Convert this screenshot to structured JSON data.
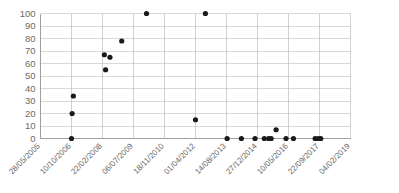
{
  "chart_data": {
    "type": "scatter",
    "title": "",
    "xlabel": "",
    "ylabel": "",
    "ylim": [
      0,
      100
    ],
    "ytick_values": [
      0,
      10,
      20,
      30,
      40,
      50,
      60,
      70,
      80,
      90,
      100
    ],
    "ytick_labels": [
      "0",
      "10",
      "20",
      "30",
      "40",
      "50",
      "60",
      "70",
      "80",
      "90",
      "100"
    ],
    "xtick_labels": [
      "28/05/2005",
      "10/10/2006",
      "22/02/2008",
      "06/07/2009",
      "18/11/2010",
      "01/04/2012",
      "14/08/2013",
      "27/12/2014",
      "10/05/2016",
      "22/09/2017",
      "04/02/2019"
    ],
    "xtick_positions": [
      0,
      1,
      2,
      3,
      4,
      5,
      6,
      7,
      8,
      9,
      10
    ],
    "grid": true,
    "legend": null,
    "marker": "circle",
    "marker_color": "#1a1a1a",
    "points": [
      {
        "x": 1.0,
        "label": "10/10/2006",
        "y": 0
      },
      {
        "x": 1.02,
        "label": "10/10/2006",
        "y": 20
      },
      {
        "x": 1.06,
        "label": "22/11/2006",
        "y": 34
      },
      {
        "x": 2.1,
        "label": "06/04/2008",
        "y": 55
      },
      {
        "x": 2.06,
        "label": "21/03/2008",
        "y": 67
      },
      {
        "x": 2.24,
        "label": "02/06/2008",
        "y": 65
      },
      {
        "x": 2.62,
        "label": "15/11/2008",
        "y": 78
      },
      {
        "x": 3.42,
        "label": "28/12/2009",
        "y": 100
      },
      {
        "x": 5.32,
        "label": "02/09/2012",
        "y": 100
      },
      {
        "x": 5.0,
        "label": "01/04/2012",
        "y": 15
      },
      {
        "x": 6.02,
        "label": "14/08/2013",
        "y": 0
      },
      {
        "x": 6.48,
        "label": "05/03/2014",
        "y": 0
      },
      {
        "x": 6.92,
        "label": "25/11/2014",
        "y": 0
      },
      {
        "x": 7.22,
        "label": "15/04/2015",
        "y": 0
      },
      {
        "x": 7.36,
        "label": "12/06/2015",
        "y": 0
      },
      {
        "x": 7.44,
        "label": "15/07/2015",
        "y": 0
      },
      {
        "x": 7.6,
        "label": "20/09/2015",
        "y": 7
      },
      {
        "x": 7.92,
        "label": "20/01/2016",
        "y": 0
      },
      {
        "x": 8.16,
        "label": "06/04/2016",
        "y": 0
      },
      {
        "x": 8.86,
        "label": "25/01/2017",
        "y": 0
      },
      {
        "x": 8.96,
        "label": "05/03/2017",
        "y": 0
      },
      {
        "x": 9.04,
        "label": "08/04/2017",
        "y": 0
      }
    ]
  }
}
